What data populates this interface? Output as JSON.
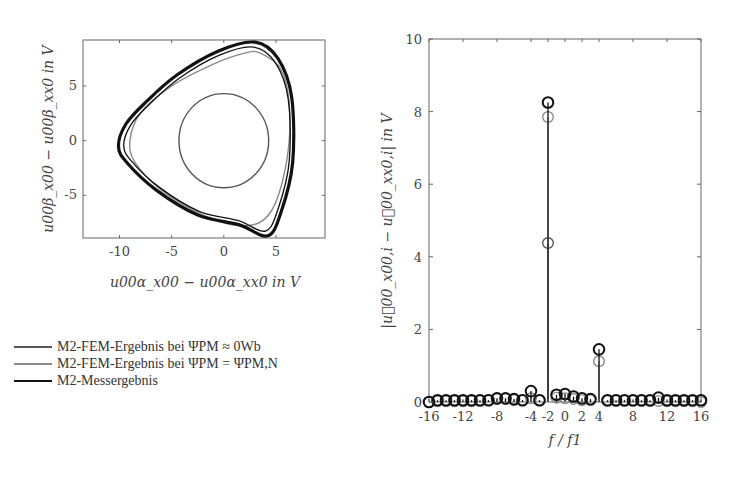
{
  "colors": {
    "fem_zero": "#555555",
    "fem_nominal": "#8a8a8a",
    "measurement": "#111111",
    "axis": "#666666"
  },
  "left_plot": {
    "xlabel": "u00α_x00 − u00α_xx0 in V",
    "ylabel": "u00β_x00 − u00β_xx0 in V",
    "xticks": [
      "-10",
      "-5",
      "0",
      "5"
    ],
    "yticks": [
      "5",
      "0",
      "-5"
    ]
  },
  "right_plot": {
    "xlabel": "f / f1",
    "ylabel": "|u⃗00_x00,i − u⃗00_xx0,i| in V",
    "xticks": [
      "-16",
      "-12",
      "-8",
      "-4",
      "-2",
      "0",
      "2",
      "4",
      "8",
      "12",
      "16"
    ],
    "yticks": [
      "0",
      "2",
      "4",
      "6",
      "8",
      "10"
    ]
  },
  "legend": {
    "items": [
      {
        "label": "M2-FEM-Ergebnis bei ΨPM ≈ 0Wb",
        "color_key": "fem_zero"
      },
      {
        "label": "M2-FEM-Ergebnis bei ΨPM = ΨPM,N",
        "color_key": "fem_nominal"
      },
      {
        "label": "M2-Messergebnis",
        "color_key": "measurement"
      }
    ]
  },
  "chart_data": [
    {
      "type": "line",
      "title": "",
      "xlabel": "u_{00α_x00} − u_{00α_xx0} in V",
      "ylabel": "u_{00β_x00} − u_{00β_xx0} in V",
      "xlim": [
        -13.5,
        9.7
      ],
      "ylim": [
        -8.9,
        9.2
      ],
      "grid": false,
      "series": [
        {
          "name": "M2-FEM-Ergebnis bei ΨPM ≈ 0Wb",
          "shape": "circle",
          "center": [
            0,
            0
          ],
          "radius": 4.3
        },
        {
          "name": "M2-FEM-Ergebnis bei ΨPM = ΨPM,N",
          "shape": "rounded-triangle",
          "x": [
            3.5,
            5.5,
            6.3,
            6.0,
            4.5,
            2.0,
            -2.0,
            -6.0,
            -8.5,
            -9.0,
            -8.0,
            -5.0,
            -1.0,
            2.0,
            3.5
          ],
          "y": [
            8.0,
            6.5,
            3.0,
            -2.0,
            -6.5,
            -7.8,
            -6.8,
            -4.5,
            -2.0,
            0.0,
            2.5,
            5.0,
            7.0,
            8.0,
            8.0
          ]
        },
        {
          "name": "M2-Messergebnis",
          "shape": "rounded-triangle",
          "x": [
            3.0,
            5.2,
            6.5,
            6.6,
            5.5,
            4.2,
            1.5,
            -2.5,
            -6.5,
            -9.3,
            -10.1,
            -9.4,
            -7.5,
            -4.5,
            -0.5,
            3.0
          ],
          "y": [
            9.0,
            7.5,
            4.0,
            -2.0,
            -6.5,
            -8.7,
            -7.7,
            -6.8,
            -4.5,
            -2.0,
            -0.5,
            1.5,
            3.5,
            6.0,
            8.2,
            9.0
          ]
        }
      ]
    },
    {
      "type": "stem",
      "title": "",
      "xlabel": "f / f_1",
      "ylabel": "|u⃗_{00_x00,i} − u⃗_{00_xx0,i}| in V",
      "xlim": [
        -16,
        16
      ],
      "ylim": [
        0,
        10
      ],
      "grid": false,
      "x": [
        -16,
        -15,
        -14,
        -13,
        -12,
        -11,
        -10,
        -9,
        -8,
        -7,
        -6,
        -5,
        -4,
        -3,
        -2,
        -1,
        0,
        1,
        2,
        3,
        4,
        5,
        6,
        7,
        8,
        9,
        10,
        11,
        12,
        13,
        14,
        15,
        16
      ],
      "series": [
        {
          "name": "M2-FEM-Ergebnis bei ΨPM ≈ 0Wb",
          "values": [
            0,
            0,
            0,
            0,
            0,
            0,
            0,
            0,
            0,
            0,
            0,
            0,
            0,
            0,
            4.38,
            0,
            0,
            0,
            0,
            0,
            0,
            0,
            0,
            0,
            0,
            0,
            0,
            0,
            0,
            0,
            0,
            0,
            0
          ]
        },
        {
          "name": "M2-FEM-Ergebnis bei ΨPM = ΨPM,N",
          "values": [
            0,
            0.02,
            0.02,
            0.02,
            0.02,
            0.02,
            0.03,
            0.05,
            0.08,
            0.08,
            0.05,
            0.05,
            0.1,
            0.05,
            7.85,
            0.12,
            0.1,
            0.08,
            0.05,
            0.05,
            1.12,
            0.03,
            0.03,
            0.03,
            0.03,
            0.03,
            0.03,
            0.03,
            0.02,
            0.02,
            0.02,
            0.02,
            0
          ]
        },
        {
          "name": "M2-Messergebnis",
          "values": [
            0,
            0.05,
            0.05,
            0.05,
            0.05,
            0.05,
            0.05,
            0.05,
            0.1,
            0.1,
            0.08,
            0.05,
            0.3,
            0.05,
            8.25,
            0.2,
            0.22,
            0.15,
            0.1,
            0.08,
            1.45,
            0.05,
            0.05,
            0.05,
            0.05,
            0.05,
            0.05,
            0.12,
            0.05,
            0.05,
            0.05,
            0.05,
            0.05
          ]
        }
      ]
    }
  ]
}
